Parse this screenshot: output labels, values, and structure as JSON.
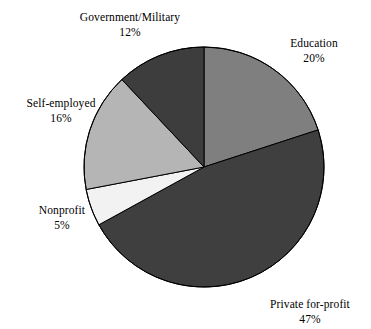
{
  "chart_data": {
    "type": "pie",
    "title": "",
    "subtitle": "",
    "xlabel": "",
    "ylabel": "",
    "legend_position": "none",
    "grid": false,
    "labels_outside": true,
    "start_angle_deg": 0,
    "direction": "clockwise",
    "categories": [
      "Education",
      "Private for-profit",
      "Nonprofit",
      "Self-employed",
      "Government/Military"
    ],
    "values": [
      20,
      47,
      5,
      16,
      12
    ],
    "value_suffix": "%",
    "colors": [
      "#7f7f7f",
      "#3f3f3f",
      "#f2f2f2",
      "#b5b5b5",
      "#3d3d3d"
    ],
    "slices": [
      {
        "name": "Education",
        "percent": 20,
        "percent_text": "20%",
        "color": "#7f7f7f",
        "start_angle": 0,
        "end_angle": 72
      },
      {
        "name": "Private for-profit",
        "percent": 47,
        "percent_text": "47%",
        "color": "#3f3f3f",
        "start_angle": 72,
        "end_angle": 241.2
      },
      {
        "name": "Nonprofit",
        "percent": 5,
        "percent_text": "5%",
        "color": "#f2f2f2",
        "start_angle": 241.2,
        "end_angle": 259.2
      },
      {
        "name": "Self-employed",
        "percent": 16,
        "percent_text": "16%",
        "color": "#b5b5b5",
        "start_angle": 259.2,
        "end_angle": 316.8
      },
      {
        "name": "Government/Military",
        "percent": 12,
        "percent_text": "12%",
        "color": "#3d3d3d",
        "start_angle": 316.8,
        "end_angle": 360
      }
    ],
    "geometry": {
      "center_x": 204,
      "center_y": 167,
      "radius": 120
    },
    "stroke_color": "#000000"
  },
  "labels": {
    "education": {
      "name": "Education",
      "percent": "20%"
    },
    "private": {
      "name": "Private for-profit",
      "percent": "47%"
    },
    "nonprofit": {
      "name": "Nonprofit",
      "percent": "5%"
    },
    "self_employed": {
      "name": "Self-employed",
      "percent": "16%"
    },
    "government": {
      "name": "Government/Military",
      "percent": "12%"
    }
  }
}
